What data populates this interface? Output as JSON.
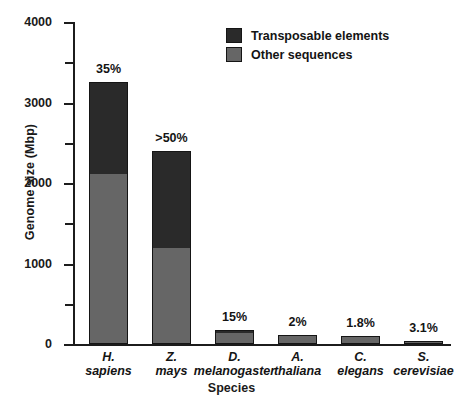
{
  "chart_data": {
    "type": "bar",
    "title": "",
    "xlabel": "Species",
    "ylabel": "Genome size (Mbp)",
    "ylim": [
      0,
      4000
    ],
    "ytick_labels": [
      "0",
      "1000",
      "2000",
      "3000",
      "4000"
    ],
    "ytick_values": [
      0,
      1000,
      2000,
      3000,
      4000
    ],
    "yminor_values": [
      500,
      1500,
      2500,
      3500
    ],
    "grid": false,
    "legend_position": "top-center",
    "stacked": true,
    "categories": [
      "H. sapiens",
      "Z. mays",
      "D. melanogaster",
      "A. thaliana",
      "C. elegans",
      "S. cerevisiae"
    ],
    "category_lines": [
      [
        "H.",
        "sapiens"
      ],
      [
        "Z.",
        "mays"
      ],
      [
        "D.",
        "melanogaster"
      ],
      [
        "A.",
        "thaliana"
      ],
      [
        "C.",
        "elegans"
      ],
      [
        "S.",
        "cerevisiae"
      ]
    ],
    "series": [
      {
        "name": "Other sequences",
        "color": "#666666",
        "values": [
          2120,
          1190,
          147,
          106,
          98,
          10
        ]
      },
      {
        "name": "Transposable elements",
        "color": "#2a2a2a",
        "values": [
          1140,
          1210,
          26,
          2,
          2,
          2
        ]
      }
    ],
    "totals": [
      3260,
      2400,
      173,
      108,
      100,
      12
    ],
    "data_labels": [
      "35%",
      ">50%",
      "15%",
      "2%",
      "1.8%",
      "3.1%"
    ],
    "annotations": [
      "Percent labels above each bar give the fraction of the genome made up of transposable elements."
    ]
  },
  "legend": {
    "items": [
      {
        "label": "Transposable elements",
        "color": "#2a2a2a"
      },
      {
        "label": "Other sequences",
        "color": "#666666"
      }
    ]
  },
  "axes": {
    "y_title": "Genome size (Mbp)",
    "x_title": "Species"
  }
}
